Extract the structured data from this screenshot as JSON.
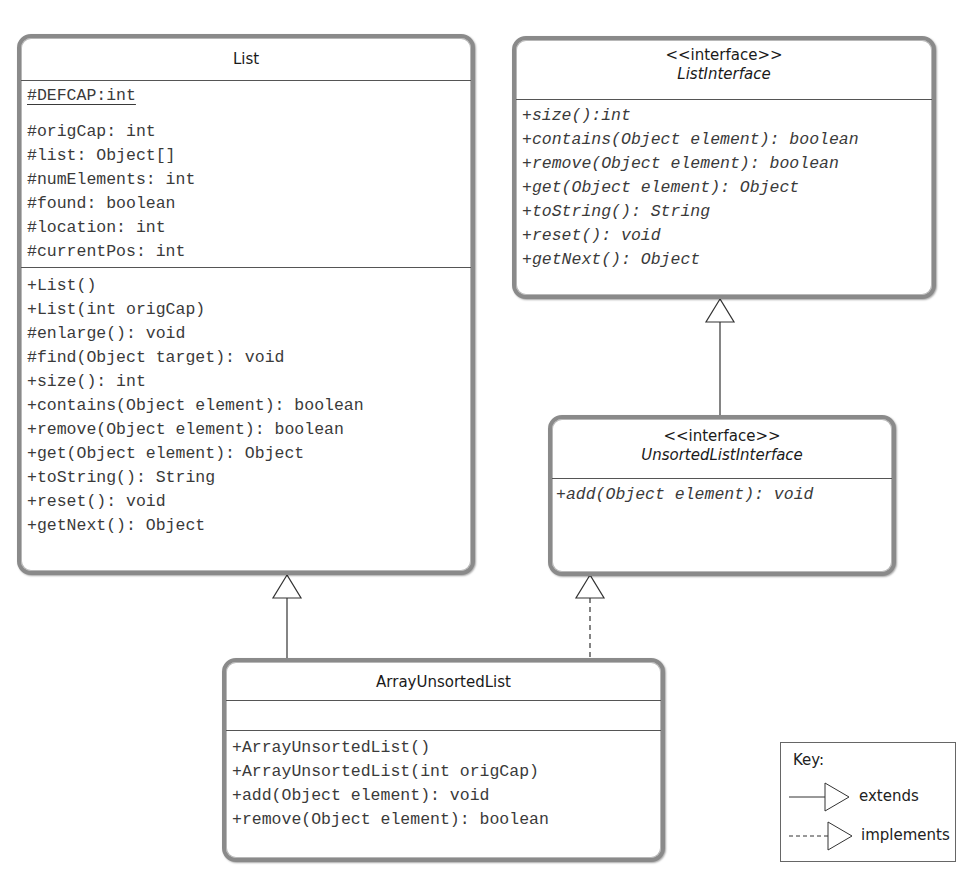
{
  "classes": {
    "list": {
      "name": "List",
      "static_attributes": [
        "#DEFCAP:int"
      ],
      "attributes": [
        "#origCap: int",
        "#list: Object[]",
        "#numElements: int",
        "#found: boolean",
        "#location: int",
        "#currentPos: int"
      ],
      "methods": [
        "+List()",
        "+List(int origCap)",
        "#enlarge(): void",
        "#find(Object target): void",
        "+size(): int",
        "+contains(Object element): boolean",
        "+remove(Object element): boolean",
        "+get(Object element): Object",
        "+toString(): String",
        "+reset(): void",
        "+getNext(): Object"
      ]
    },
    "list_interface": {
      "stereotype": "<<interface>>",
      "name": "ListInterface",
      "methods": [
        "+size():int",
        "+contains(Object element): boolean",
        "+remove(Object element): boolean",
        "+get(Object element): Object",
        "+toString(): String",
        "+reset(): void",
        "+getNext(): Object"
      ]
    },
    "unsorted_list_interface": {
      "stereotype": "<<interface>>",
      "name": "UnsortedListInterface",
      "methods": [
        "+add(Object element): void"
      ]
    },
    "array_unsorted_list": {
      "name": "ArrayUnsortedList",
      "attributes": [],
      "methods": [
        "+ArrayUnsortedList()",
        "+ArrayUnsortedList(int origCap)",
        "+add(Object element): void",
        "+remove(Object element): boolean"
      ]
    }
  },
  "relationships": [
    {
      "from": "ArrayUnsortedList",
      "to": "List",
      "type": "extends"
    },
    {
      "from": "ArrayUnsortedList",
      "to": "UnsortedListInterface",
      "type": "implements"
    },
    {
      "from": "UnsortedListInterface",
      "to": "ListInterface",
      "type": "extends"
    }
  ],
  "key": {
    "title": "Key:",
    "extends_label": "extends",
    "implements_label": "implements"
  }
}
